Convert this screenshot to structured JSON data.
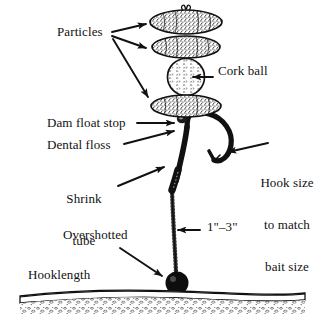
{
  "figure": {
    "background_color": "#ffffff",
    "ink_color": "#111111"
  },
  "labels": {
    "particles": "Particles",
    "cork_ball": "Cork ball",
    "dam_float_stop": "Dam float stop",
    "dental_floss": "Dental floss",
    "shrink_tube_line1": "Shrink",
    "shrink_tube_line2": "tube",
    "hook_size_line1": "Hook size",
    "hook_size_line2": "to match",
    "hook_size_line3": "bait size",
    "measurement": "1\"–3\"",
    "overshotted": "Overshotted",
    "hooklength": "Hooklength"
  },
  "components": {
    "particle_top": "particle-bait",
    "particle_second": "particle-bait",
    "cork_ball": "cork-ball",
    "particle_bottom": "particle-bait",
    "float_stop": "dam-float-stop",
    "hook": "fishing-hook",
    "shrink_tube": "shrink-tube",
    "hooklength_line": "hooklength-line",
    "shot": "overshotted-shot",
    "lakebed": "lakebed-ground"
  },
  "annotations": {
    "arrow_count": 7,
    "arrow_targets": [
      "particle-top",
      "particle-second",
      "particle-bottom",
      "dam-float-stop",
      "dental-floss",
      "shrink-tube",
      "hook-point",
      "hooklength-line",
      "overshotted-shot"
    ]
  }
}
